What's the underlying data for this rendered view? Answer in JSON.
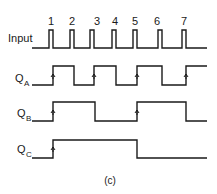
{
  "diagram": {
    "caption": "(c)",
    "pulse_numbers": [
      "1",
      "2",
      "3",
      "4",
      "5",
      "6",
      "7"
    ],
    "signals": [
      {
        "name": "Input",
        "label": "Input",
        "subscript": ""
      },
      {
        "name": "QA",
        "label": "Q",
        "subscript": "A"
      },
      {
        "name": "QB",
        "label": "Q",
        "subscript": "B"
      },
      {
        "name": "QC",
        "label": "Q",
        "subscript": "C"
      }
    ],
    "input_pulse_x": [
      49,
      70,
      90,
      112,
      133,
      158,
      182
    ],
    "qa_transitions": [
      53,
      74,
      94,
      116,
      137,
      162,
      186
    ],
    "qb_transitions": [
      53,
      95,
      137,
      186
    ],
    "qc_transitions": [
      53,
      137
    ],
    "line_color": "#1a1a1a"
  }
}
